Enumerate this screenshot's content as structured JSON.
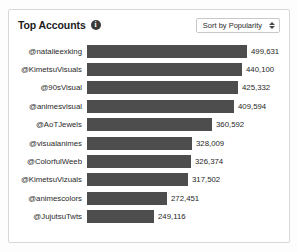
{
  "card": {
    "title": "Top Accounts",
    "info_icon": "info-icon",
    "sort_select": {
      "value": "Sort by Popularity",
      "caret_icon": "updown-caret-icon"
    }
  },
  "chart_data": {
    "type": "bar",
    "orientation": "horizontal",
    "title": "Top Accounts",
    "xlabel": "",
    "ylabel": "",
    "grid": false,
    "legend": null,
    "value_labels": true,
    "bar_color": "#4d4d4d",
    "categories": [
      "@natalieexking",
      "@KimetsuVisuals",
      "@90sVisual",
      "@animesvisual",
      "@AoTJewels",
      "@visualanimes",
      "@ColorfulWeeb",
      "@KimetsuVizuals",
      "@animescolors",
      "@JujutsuTwts"
    ],
    "values": [
      499631,
      440100,
      425332,
      409594,
      360592,
      328009,
      326374,
      317502,
      272451,
      249116
    ],
    "value_text": [
      "499,631",
      "440,100",
      "425,332",
      "409,594",
      "360,592",
      "328,009",
      "326,374",
      "317,502",
      "272,451",
      "249,116"
    ],
    "bar_pixel_widths": [
      160,
      155,
      151,
      147,
      125,
      105,
      104,
      101,
      80,
      67
    ],
    "xlim": [
      0,
      499631
    ]
  }
}
